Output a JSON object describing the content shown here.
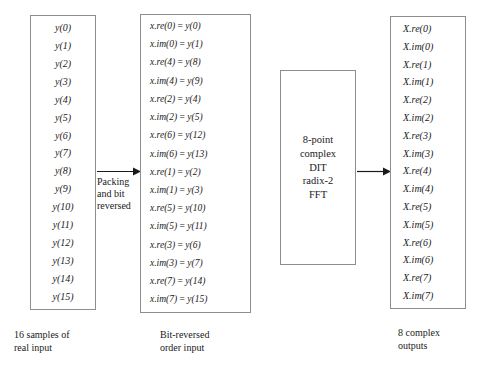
{
  "diagram": {
    "stroke_color": "#8d8d8d",
    "text_color": "#1a1a1a"
  },
  "left_column": {
    "name": "16 samples of real input",
    "entries": [
      "y(0)",
      "y(1)",
      "y(2)",
      "y(3)",
      "y(4)",
      "y(5)",
      "y(6)",
      "y(7)",
      "y(8)",
      "y(9)",
      "y(10)",
      "y(11)",
      "y(12)",
      "y(13)",
      "y(14)",
      "y(15)"
    ],
    "caption": "16 samples of\nreal input"
  },
  "middle_column": {
    "name": "Bit-reversed order input",
    "entries": [
      "x.re(0) = y(0)",
      "x.im(0) = y(1)",
      "x.re(4) = y(8)",
      "x.im(4) = y(9)",
      "x.re(2) = y(4)",
      "x.im(2) = y(5)",
      "x.re(6) = y(12)",
      "x.im(6) = y(13)",
      "x.re(1) = y(2)",
      "x.im(1) = y(3)",
      "x.re(5) = y(10)",
      "x.im(5) = y(11)",
      "x.re(3) = y(6)",
      "x.im(3) = y(7)",
      "x.re(7) = y(14)",
      "x.im(7) = y(15)"
    ],
    "caption": "Bit-reversed\norder input"
  },
  "right_column": {
    "name": "8 complex outputs",
    "entries": [
      "X.re(0)",
      "X.im(0)",
      "X.re(1)",
      "X.im(1)",
      "X.re(2)",
      "X.im(2)",
      "X.re(3)",
      "X.im(3)",
      "X.re(4)",
      "X.im(4)",
      "X.re(5)",
      "X.im(5)",
      "X.re(6)",
      "X.im(6)",
      "X.re(7)",
      "X.im(7)"
    ],
    "caption": "8 complex\noutputs"
  },
  "fft_block": {
    "lines": [
      "8-point",
      "complex",
      "DIT",
      "radix-2",
      "FFT"
    ]
  },
  "arrows": {
    "left": {
      "label": "Packing\nand bit\nreversed",
      "icon": "arrow-right-icon"
    },
    "right": {
      "label": "",
      "icon": "arrow-right-icon"
    }
  }
}
